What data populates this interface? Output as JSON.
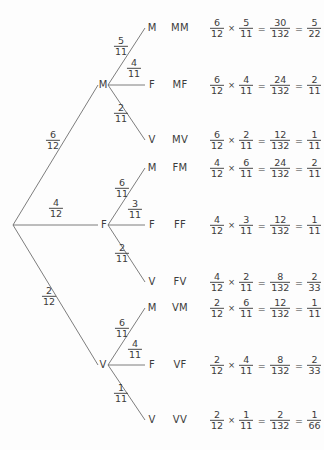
{
  "diagram": {
    "line_color": "#6e6e6e",
    "text_color": "#3c3c3c",
    "background": "#fdfdfd",
    "root": {
      "label": ""
    },
    "level1": [
      {
        "id": "M",
        "label": "M",
        "prob_num": "6",
        "prob_den": "12",
        "x": 103,
        "y": 85,
        "frac_x": 53,
        "frac_y": 140
      },
      {
        "id": "F",
        "label": "F",
        "prob_num": "4",
        "prob_den": "12",
        "x": 104,
        "y": 225,
        "frac_x": 56,
        "frac_y": 208
      },
      {
        "id": "V",
        "label": "V",
        "prob_num": "2",
        "prob_den": "12",
        "x": 103,
        "y": 365,
        "frac_x": 49,
        "frac_y": 296
      }
    ],
    "branches": [
      {
        "parent": "M",
        "label": "M",
        "prob_num": "5",
        "prob_den": "11",
        "y": 28,
        "frac_x": 121,
        "frac_y": 46
      },
      {
        "parent": "M",
        "label": "F",
        "prob_num": "4",
        "prob_den": "11",
        "y": 85,
        "frac_x": 134,
        "frac_y": 68
      },
      {
        "parent": "M",
        "label": "V",
        "prob_num": "2",
        "prob_den": "11",
        "y": 140,
        "frac_x": 121,
        "frac_y": 113
      },
      {
        "parent": "F",
        "label": "M",
        "prob_num": "6",
        "prob_den": "11",
        "y": 168,
        "frac_x": 122,
        "frac_y": 188
      },
      {
        "parent": "F",
        "label": "F",
        "prob_num": "3",
        "prob_den": "11",
        "y": 225,
        "frac_x": 135,
        "frac_y": 209
      },
      {
        "parent": "F",
        "label": "V",
        "prob_num": "2",
        "prob_den": "11",
        "y": 282,
        "frac_x": 122,
        "frac_y": 253
      },
      {
        "parent": "V",
        "label": "M",
        "prob_num": "6",
        "prob_den": "11",
        "y": 308,
        "frac_x": 122,
        "frac_y": 328
      },
      {
        "parent": "V",
        "label": "F",
        "prob_num": "4",
        "prob_den": "11",
        "y": 365,
        "frac_x": 135,
        "frac_y": 349
      },
      {
        "parent": "V",
        "label": "V",
        "prob_num": "1",
        "prob_den": "11",
        "y": 420,
        "frac_x": 121,
        "frac_y": 393
      }
    ],
    "outcomes": [
      {
        "code": "MM",
        "y": 28,
        "a_num": "6",
        "a_den": "12",
        "b_num": "5",
        "b_den": "11",
        "product_num": "30",
        "product_den": "132",
        "simplified_num": "5",
        "simplified_den": "22"
      },
      {
        "code": "MF",
        "y": 85,
        "a_num": "6",
        "a_den": "12",
        "b_num": "4",
        "b_den": "11",
        "product_num": "24",
        "product_den": "132",
        "simplified_num": "2",
        "simplified_den": "11"
      },
      {
        "code": "MV",
        "y": 140,
        "a_num": "6",
        "a_den": "12",
        "b_num": "2",
        "b_den": "11",
        "product_num": "12",
        "product_den": "132",
        "simplified_num": "1",
        "simplified_den": "11"
      },
      {
        "code": "FM",
        "y": 168,
        "a_num": "4",
        "a_den": "12",
        "b_num": "6",
        "b_den": "11",
        "product_num": "24",
        "product_den": "132",
        "simplified_num": "2",
        "simplified_den": "11"
      },
      {
        "code": "FF",
        "y": 225,
        "a_num": "4",
        "a_den": "12",
        "b_num": "3",
        "b_den": "11",
        "product_num": "12",
        "product_den": "132",
        "simplified_num": "1",
        "simplified_den": "11"
      },
      {
        "code": "FV",
        "y": 282,
        "a_num": "4",
        "a_den": "12",
        "b_num": "2",
        "b_den": "11",
        "product_num": "8",
        "product_den": "132",
        "simplified_num": "2",
        "simplified_den": "33"
      },
      {
        "code": "VM",
        "y": 308,
        "a_num": "2",
        "a_den": "12",
        "b_num": "6",
        "b_den": "11",
        "product_num": "12",
        "product_den": "132",
        "simplified_num": "1",
        "simplified_den": "11"
      },
      {
        "code": "VF",
        "y": 365,
        "a_num": "2",
        "a_den": "12",
        "b_num": "4",
        "b_den": "11",
        "product_num": "8",
        "product_den": "132",
        "simplified_num": "2",
        "simplified_den": "33"
      },
      {
        "code": "VV",
        "y": 420,
        "a_num": "2",
        "a_den": "12",
        "b_num": "1",
        "b_den": "11",
        "product_num": "2",
        "product_den": "132",
        "simplified_num": "1",
        "simplified_den": "66"
      }
    ],
    "symbols": {
      "multiply": "×",
      "equals": "="
    },
    "geometry": {
      "root_x": 13,
      "root_y": 225,
      "node_x": 103,
      "leaf_x": 145,
      "leaf_label_x": 152,
      "outcome_x": 180,
      "equation_x": 209
    }
  }
}
